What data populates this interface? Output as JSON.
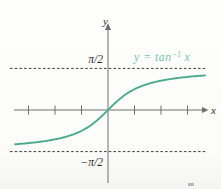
{
  "chart_data": {
    "type": "line",
    "function": "arctan",
    "title": "",
    "xlabel": "x",
    "ylabel": "y",
    "legend": {
      "text": "y = tan⁻¹ x",
      "prefix": "y = tan",
      "sup": "−1",
      "suffix": " x"
    },
    "x_range": [
      -3.5,
      3.66
    ],
    "x_ticks": [
      -3,
      -2,
      -1,
      1,
      2,
      3
    ],
    "asymptotes": [
      {
        "y": 1.5707963,
        "label": "π/2"
      },
      {
        "y": -1.5707963,
        "label": "−π/2"
      }
    ],
    "grid": false,
    "legend_position": "top-right",
    "colors": {
      "curve": "#49ab8e",
      "legend": "#74c3a9",
      "axis": "#6e6e6e",
      "asymptote": "#3c3c3c",
      "tick_label": "#2d2d2d"
    }
  }
}
